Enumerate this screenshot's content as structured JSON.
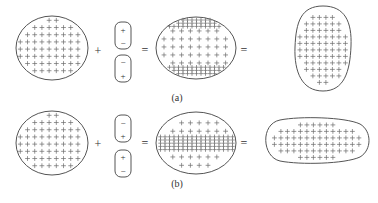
{
  "figure": {
    "panels": [
      {
        "id": "a",
        "label": "(a)",
        "operators": [
          "+",
          "=",
          "="
        ],
        "neutral_body": {
          "shape": "ellipse",
          "charge": "+"
        },
        "dipoles": [
          {
            "top": "+",
            "bottom": "−"
          },
          {
            "top": "−",
            "bottom": "+"
          }
        ],
        "polarized_body": {
          "shape": "ellipse",
          "charge_concentration": "top and bottom edges"
        },
        "result": {
          "shape": "vertically elongated oval",
          "charge": "+"
        }
      },
      {
        "id": "b",
        "label": "(b)",
        "operators": [
          "+",
          "=",
          "="
        ],
        "neutral_body": {
          "shape": "ellipse",
          "charge": "+"
        },
        "dipoles": [
          {
            "top": "−",
            "bottom": "+"
          },
          {
            "top": "+",
            "bottom": "−"
          }
        ],
        "polarized_body": {
          "shape": "ellipse",
          "charge_concentration": "horizontal middle band"
        },
        "result": {
          "shape": "horizontally elongated oval",
          "charge": "+"
        }
      }
    ],
    "colors": {
      "outline": "#555555",
      "charge": "#6a6a6a",
      "background": "#ffffff"
    }
  }
}
